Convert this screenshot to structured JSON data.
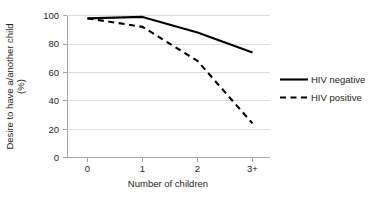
{
  "chart_data": {
    "type": "line",
    "title": "",
    "xlabel": "Number of children",
    "ylabel": "Desire to have a/another child",
    "ylabel_unit": "(%)",
    "categories": [
      "0",
      "1",
      "2",
      "3+"
    ],
    "ylim": [
      0,
      100
    ],
    "yticks": [
      "0",
      "20",
      "40",
      "60",
      "80",
      "100"
    ],
    "grid": "horizontal",
    "legend_position": "right",
    "series": [
      {
        "name": "HIV negative",
        "style": "solid",
        "color": "#000000",
        "values": [
          98,
          99,
          88,
          74
        ]
      },
      {
        "name": "HIV positive",
        "style": "dashed",
        "color": "#000000",
        "values": [
          98,
          92,
          68,
          24
        ]
      }
    ]
  },
  "axes": {
    "y_tick_0": "0",
    "y_tick_1": "20",
    "y_tick_2": "40",
    "y_tick_3": "60",
    "y_tick_4": "80",
    "y_tick_5": "100",
    "x_tick_0": "0",
    "x_tick_1": "1",
    "x_tick_2": "2",
    "x_tick_3": "3+",
    "x_title": "Number of children",
    "y_title_line1": "Desire to have a/another child",
    "y_title_line2": "(%)"
  },
  "legend": {
    "item_negative": "HIV negative",
    "item_positive": "HIV positive"
  }
}
